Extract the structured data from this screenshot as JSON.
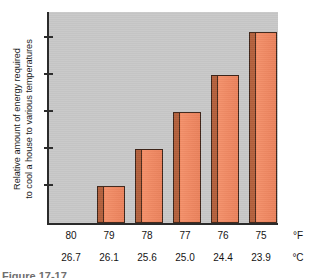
{
  "figure": {
    "caption_clipped": "Figure 17-17"
  },
  "chart_data": {
    "type": "bar",
    "title": "",
    "ylabel_lines": [
      "Relative amount of energy required",
      "to cool a house to various temperatures"
    ],
    "ylabel": "Relative amount of energy required to cool a house to various temperatures",
    "xlabel": "",
    "categories": [
      "80",
      "79",
      "78",
      "77",
      "76",
      "75"
    ],
    "categories_secondary": [
      "26.7",
      "26.1",
      "25.6",
      "25.0",
      "24.4",
      "23.9"
    ],
    "unit_primary": "°F",
    "unit_secondary": "°C",
    "values": [
      0,
      1,
      2,
      3,
      4,
      5.15
    ],
    "ylim": [
      0,
      5.7
    ],
    "yticks": [
      1,
      2,
      3,
      4,
      5
    ],
    "ytick_labels": [
      "",
      "",
      "",
      "",
      ""
    ],
    "grid": false,
    "legend": "none",
    "series": [
      {
        "name": "Relative cooling energy",
        "values": [
          0,
          1,
          2,
          3,
          4,
          5.15
        ]
      }
    ],
    "colors": {
      "bar_face": "#f08a62",
      "bar_side": "#b3603c",
      "bar_outline": "#3d2418",
      "plot_background": "#c8c8c8",
      "axis": "#2b2b2b",
      "text": "#141414"
    }
  }
}
